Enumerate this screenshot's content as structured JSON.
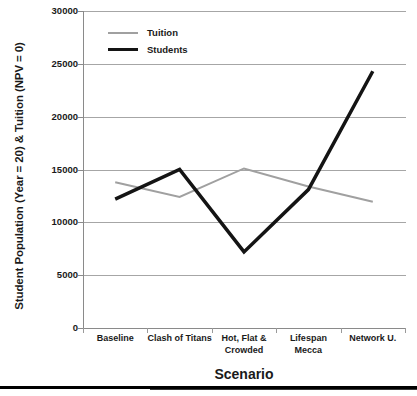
{
  "chart_data": {
    "type": "line",
    "title": "",
    "xlabel": "Scenario",
    "ylabel": "Student Population (Year = 20) & Tuition (NPV = 0)",
    "categories": [
      "Baseline",
      "Clash of Titans",
      "Hot, Flat & Crowded",
      "Lifespan Mecca",
      "Network U."
    ],
    "category_lines": [
      [
        "Baseline"
      ],
      [
        "Clash of Titans"
      ],
      [
        "Hot, Flat &",
        "Crowded"
      ],
      [
        "Lifespan Mecca"
      ],
      [
        "Network U."
      ]
    ],
    "series": [
      {
        "name": "Tuition",
        "values": [
          13800,
          12400,
          15100,
          13400,
          11950
        ],
        "color": "#a0a0a0",
        "width": 2
      },
      {
        "name": "Students",
        "values": [
          12200,
          15000,
          7200,
          13100,
          24300
        ],
        "color": "#141414",
        "width": 3.5
      }
    ],
    "ylim": [
      0,
      30000
    ],
    "ytick_step": 5000,
    "yticks": [
      0,
      5000,
      10000,
      15000,
      20000,
      25000,
      30000
    ],
    "ytick_labels": [
      "0",
      "5000",
      "10000",
      "15000",
      "20000",
      "25000",
      "30000"
    ],
    "grid": true,
    "grid_color": "#a6a6a6",
    "legend_position": "top-left",
    "legend_entries": [
      "Tuition",
      "Students"
    ],
    "axis_color": "#8a8a8a",
    "background": "#ffffff"
  }
}
